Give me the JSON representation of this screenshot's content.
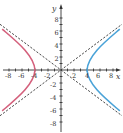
{
  "figure": {
    "x_axis_label": "x",
    "y_axis_label": "y",
    "x_ticks": [
      "-8",
      "-6",
      "-4",
      "-2",
      "2",
      "4",
      "6",
      "8"
    ],
    "y_ticks": [
      "8",
      "6",
      "4",
      "2",
      "-2",
      "-4",
      "-6",
      "-8"
    ],
    "colors": {
      "left_branch": "#d4607c",
      "right_branch": "#4aa3d8",
      "axes": "#333333",
      "asymptotes": "#333333"
    },
    "curve": {
      "a": 4,
      "b": 3,
      "asymptote_slope": 0.75
    }
  }
}
